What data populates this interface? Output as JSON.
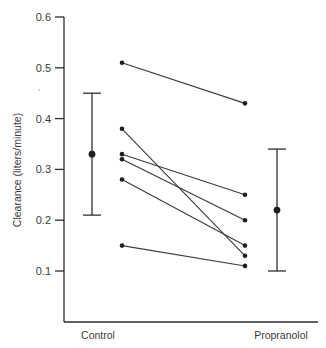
{
  "chart_data": {
    "type": "scatter",
    "subtype": "paired-dot-plot with mean ± error bars",
    "title": "",
    "xlabel": "",
    "ylabel": "Clearance (liters/minute)",
    "ylim": [
      0.0,
      0.6
    ],
    "yticks": [
      0.1,
      0.2,
      0.3,
      0.4,
      0.5,
      0.6
    ],
    "ytick_labels": [
      "0.1",
      "0.2",
      "0.3",
      "0.4",
      "0.5",
      "0.6"
    ],
    "categories": [
      "Control",
      "Propranolol"
    ],
    "grid": false,
    "legend": null,
    "pairs": [
      {
        "control": 0.51,
        "propranolol": 0.43
      },
      {
        "control": 0.38,
        "propranolol": 0.13
      },
      {
        "control": 0.33,
        "propranolol": 0.25
      },
      {
        "control": 0.32,
        "propranolol": 0.2
      },
      {
        "control": 0.28,
        "propranolol": 0.15
      },
      {
        "control": 0.15,
        "propranolol": 0.11
      }
    ],
    "summary": [
      {
        "group": "Control",
        "mean": 0.33,
        "upper": 0.45,
        "lower": 0.21
      },
      {
        "group": "Propranolol",
        "mean": 0.22,
        "upper": 0.34,
        "lower": 0.1
      }
    ]
  },
  "layout": {
    "y_px_top": 17,
    "y_value_top": 0.6,
    "px_per_unit": 508,
    "axis_x": 64,
    "axis_bottom_y": 322,
    "axis_right_x": 318,
    "tick_len": 9,
    "pair_x_control": 122,
    "pair_x_propranolol": 245,
    "errbar_x_control": 92,
    "errbar_x_propranolol": 277,
    "cap_half": 9,
    "cat_label_x_control": 98,
    "cat_label_x_propranolol": 281,
    "cat_label_y": 339,
    "ylabel_x": 21,
    "ylabel_y": 170
  }
}
